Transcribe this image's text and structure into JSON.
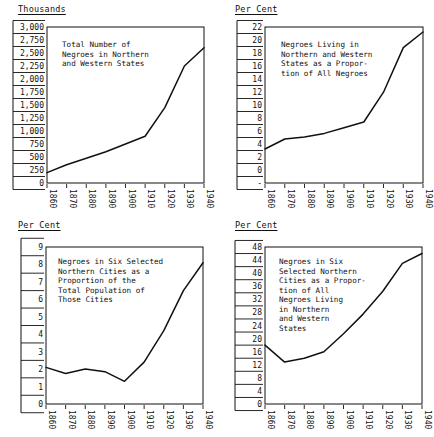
{
  "figure": {
    "panels": [
      "top_left",
      "top_right",
      "bottom_left",
      "bottom_right"
    ]
  },
  "units": {
    "thousands": "Thousands",
    "per_cent": "Per Cent"
  },
  "chart_data": [
    {
      "id": "top_left",
      "type": "line",
      "title": "Total Number of\nNegroes in Northern\nand Western States",
      "title_lines": [
        "Total Number of",
        "Negroes in Northern",
        "and Western States"
      ],
      "xlabel": "",
      "ylabel": "Thousands",
      "unit_header": "Thousands",
      "x": [
        1860,
        1870,
        1880,
        1890,
        1900,
        1910,
        1920,
        1930,
        1940
      ],
      "values": [
        200,
        350,
        475,
        600,
        750,
        900,
        1450,
        2250,
        2600
      ],
      "categories": [
        "1860",
        "1870",
        "1880",
        "1890",
        "1900",
        "1910",
        "1920",
        "1930",
        "1940"
      ],
      "xtick_labels": [
        "1860",
        "1870",
        "1880",
        "1890",
        "1900",
        "1910",
        "1920",
        "1930",
        "1940"
      ],
      "ytick_labels": [
        "3,000",
        "2,750",
        "2,500",
        "2,250",
        "2,000",
        "1,750",
        "1,500",
        "1,250",
        "1,000",
        "750",
        "500",
        "250",
        "0"
      ],
      "ylim": [
        0,
        3000
      ],
      "ystep": 250,
      "xlim": [
        1860,
        1940
      ],
      "grid": false,
      "legend": "none"
    },
    {
      "id": "top_right",
      "type": "line",
      "title": "Negroes Living in\nNorthern and Western\nStates as a Propor-\ntion of All Negroes",
      "title_lines": [
        "Negroes Living in",
        "Northern and Western",
        "States as a Propor-",
        "tion of All Negroes"
      ],
      "xlabel": "",
      "ylabel": "Per Cent",
      "unit_header": "Per Cent",
      "x": [
        1860,
        1870,
        1880,
        1890,
        1900,
        1910,
        1920,
        1930,
        1940
      ],
      "values": [
        4.8,
        6.2,
        6.5,
        7.0,
        7.8,
        8.6,
        12.8,
        19.1,
        21.3
      ],
      "categories": [
        "1860",
        "1870",
        "1880",
        "1890",
        "1900",
        "1910",
        "1920",
        "1930",
        "1940"
      ],
      "xtick_labels": [
        "1860",
        "1870",
        "1880",
        "1890",
        "1900",
        "1910",
        "1920",
        "1930",
        "1940"
      ],
      "ytick_labels": [
        "22",
        "20",
        "18",
        "16",
        "14",
        "12",
        "10",
        "8",
        "6",
        "4",
        "2",
        "0",
        "-"
      ],
      "ylim": [
        0,
        22
      ],
      "ystep": 2,
      "xlim": [
        1860,
        1940
      ],
      "grid": false,
      "legend": "none"
    },
    {
      "id": "bottom_left",
      "type": "line",
      "title": "Negroes in Six Selected\nNorthern Cities as a\nProportion of the\nTotal Population of\nThose Cities",
      "title_lines": [
        "Negroes in Six Selected",
        "Northern Cities as a",
        "Proportion of the",
        "Total Population of",
        "Those Cities"
      ],
      "xlabel": "",
      "ylabel": "Per Cent",
      "unit_header": "Per Cent",
      "x": [
        1860,
        1870,
        1880,
        1890,
        1900,
        1910,
        1920,
        1930,
        1940
      ],
      "values": [
        2.1,
        1.75,
        2.0,
        1.85,
        1.3,
        2.4,
        4.2,
        6.5,
        8.1
      ],
      "categories": [
        "1860",
        "1870",
        "1880",
        "1890",
        "1900",
        "1910",
        "1920",
        "1930",
        "1940"
      ],
      "xtick_labels": [
        "1860",
        "1870",
        "1880",
        "1890",
        "1900",
        "1910",
        "1920",
        "1930",
        "1940"
      ],
      "ytick_labels": [
        "9",
        "8",
        "7",
        "6",
        "5",
        "4",
        "3",
        "2",
        "1",
        "0"
      ],
      "ylim": [
        0,
        9
      ],
      "ystep": 1,
      "xlim": [
        1860,
        1940
      ],
      "grid": false,
      "legend": "none"
    },
    {
      "id": "bottom_right",
      "type": "line",
      "title": "Negroes in Six\nSelected Northern\nCities as a Propor-\ntion of All\nNegroes Living\nin Northern\nand Western\nStates",
      "title_lines": [
        "Negroes in Six",
        "Selected Northern",
        "Cities as a Propor-",
        "tion of All",
        "Negroes Living",
        "in Northern",
        "and Western",
        "States"
      ],
      "xlabel": "",
      "ylabel": "Per Cent",
      "unit_header": "Per Cent",
      "x": [
        1860,
        1870,
        1880,
        1890,
        1900,
        1910,
        1920,
        1930,
        1940
      ],
      "values": [
        18.0,
        12.8,
        14.0,
        16.0,
        21.5,
        27.5,
        34.5,
        43.0,
        46.0
      ],
      "categories": [
        "1860",
        "1870",
        "1880",
        "1890",
        "1900",
        "1910",
        "1920",
        "1930",
        "1940"
      ],
      "xtick_labels": [
        "1860",
        "1870",
        "1880",
        "1890",
        "1900",
        "1910",
        "1920",
        "1930",
        "1940"
      ],
      "ytick_labels": [
        "48",
        "44",
        "40",
        "36",
        "32",
        "28",
        "24",
        "20",
        "16",
        "12",
        "8",
        "4",
        "0"
      ],
      "ylim": [
        0,
        48
      ],
      "ystep": 4,
      "xlim": [
        1860,
        1940
      ],
      "grid": false,
      "legend": "none"
    }
  ]
}
